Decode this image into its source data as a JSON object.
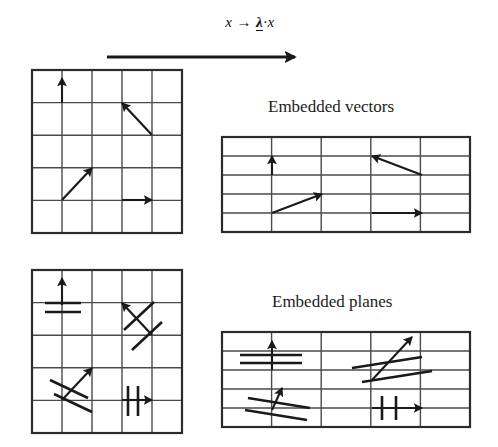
{
  "figure": {
    "title_formula": {
      "lhs": "x",
      "arrow": "→",
      "lambda": "λ",
      "dot": "·",
      "rhs": "x",
      "full": "x → λ·x",
      "description": "scaling map x maps to lambda times x"
    },
    "captions": {
      "vectors": "Embedded vectors",
      "planes": "Embedded planes"
    },
    "colors": {
      "ink": "#1a1a1a",
      "grid_line": "#4a4a4a",
      "grid_border": "#2b2b2b",
      "background": "#ffffff"
    },
    "big_arrow": {
      "name": "transformation-arrow",
      "x1": 107,
      "y1": 57,
      "x2": 295,
      "y2": 57,
      "stroke_width": 3
    },
    "panels": [
      {
        "id": "source-vectors",
        "label": "source grid with vectors",
        "x": 32,
        "y": 70,
        "width": 150,
        "height": 163,
        "cols": 5,
        "rows": 5,
        "arrows": [
          {
            "name": "vector-up",
            "x1": 62,
            "y1": 103,
            "x2": 62,
            "y2": 78
          },
          {
            "name": "vector-up-left",
            "x1": 152,
            "y1": 135,
            "x2": 122,
            "y2": 103
          },
          {
            "name": "vector-up-right",
            "x1": 62,
            "y1": 200,
            "x2": 92,
            "y2": 168
          },
          {
            "name": "vector-right",
            "x1": 122,
            "y1": 200,
            "x2": 152,
            "y2": 200
          }
        ],
        "planes": []
      },
      {
        "id": "image-vectors",
        "label": "stretched grid with embedded vectors",
        "x": 222,
        "y": 137,
        "width": 248,
        "height": 95,
        "cols": 5,
        "rows": 5,
        "arrows": [
          {
            "name": "vector-up",
            "x1": 272,
            "y1": 175,
            "x2": 272,
            "y2": 156
          },
          {
            "name": "vector-up-left",
            "x1": 422,
            "y1": 175,
            "x2": 372,
            "y2": 156
          },
          {
            "name": "vector-up-right",
            "x1": 272,
            "y1": 213,
            "x2": 322,
            "y2": 194
          },
          {
            "name": "vector-right",
            "x1": 372,
            "y1": 213,
            "x2": 422,
            "y2": 213
          }
        ],
        "planes": []
      },
      {
        "id": "source-planes",
        "label": "source grid with planes",
        "x": 32,
        "y": 270,
        "width": 150,
        "height": 163,
        "cols": 5,
        "rows": 5,
        "arrows": [
          {
            "name": "vector-up",
            "x1": 62,
            "y1": 305,
            "x2": 62,
            "y2": 278
          },
          {
            "name": "vector-up-left",
            "x1": 152,
            "y1": 335,
            "x2": 122,
            "y2": 303
          },
          {
            "name": "vector-up-right",
            "x1": 62,
            "y1": 400,
            "x2": 92,
            "y2": 368
          },
          {
            "name": "vector-right",
            "x1": 122,
            "y1": 400,
            "x2": 152,
            "y2": 400
          }
        ],
        "planes": [
          {
            "name": "plane-line",
            "x1": 45,
            "y1": 303,
            "x2": 81,
            "y2": 303
          },
          {
            "name": "plane-line",
            "x1": 45,
            "y1": 312,
            "x2": 81,
            "y2": 312
          },
          {
            "name": "plane-line",
            "x1": 124,
            "y1": 330,
            "x2": 154,
            "y2": 302
          },
          {
            "name": "plane-line",
            "x1": 132,
            "y1": 350,
            "x2": 162,
            "y2": 322
          },
          {
            "name": "plane-line",
            "x1": 50,
            "y1": 380,
            "x2": 88,
            "y2": 398
          },
          {
            "name": "plane-line",
            "x1": 54,
            "y1": 394,
            "x2": 92,
            "y2": 412
          },
          {
            "name": "plane-line",
            "x1": 128,
            "y1": 386,
            "x2": 128,
            "y2": 416
          },
          {
            "name": "plane-line",
            "x1": 138,
            "y1": 386,
            "x2": 138,
            "y2": 416
          }
        ]
      },
      {
        "id": "image-planes",
        "label": "stretched grid with embedded planes",
        "x": 222,
        "y": 332,
        "width": 248,
        "height": 95,
        "cols": 5,
        "rows": 5,
        "arrows": [
          {
            "name": "vector-up",
            "x1": 272,
            "y1": 370,
            "x2": 272,
            "y2": 341
          },
          {
            "name": "vector-up-right",
            "x1": 372,
            "y1": 380,
            "x2": 412,
            "y2": 337
          },
          {
            "name": "vector-up-small",
            "x1": 272,
            "y1": 410,
            "x2": 282,
            "y2": 388
          },
          {
            "name": "vector-right",
            "x1": 372,
            "y1": 408,
            "x2": 422,
            "y2": 408
          }
        ],
        "planes": [
          {
            "name": "plane-line",
            "x1": 240,
            "y1": 355,
            "x2": 302,
            "y2": 355
          },
          {
            "name": "plane-line",
            "x1": 240,
            "y1": 363,
            "x2": 302,
            "y2": 363
          },
          {
            "name": "plane-line",
            "x1": 352,
            "y1": 368,
            "x2": 422,
            "y2": 357
          },
          {
            "name": "plane-line",
            "x1": 362,
            "y1": 382,
            "x2": 432,
            "y2": 371
          },
          {
            "name": "plane-line",
            "x1": 248,
            "y1": 398,
            "x2": 310,
            "y2": 408
          },
          {
            "name": "plane-line",
            "x1": 245,
            "y1": 410,
            "x2": 307,
            "y2": 420
          },
          {
            "name": "plane-line",
            "x1": 382,
            "y1": 396,
            "x2": 382,
            "y2": 420
          },
          {
            "name": "plane-line",
            "x1": 396,
            "y1": 396,
            "x2": 396,
            "y2": 420
          }
        ]
      }
    ]
  }
}
